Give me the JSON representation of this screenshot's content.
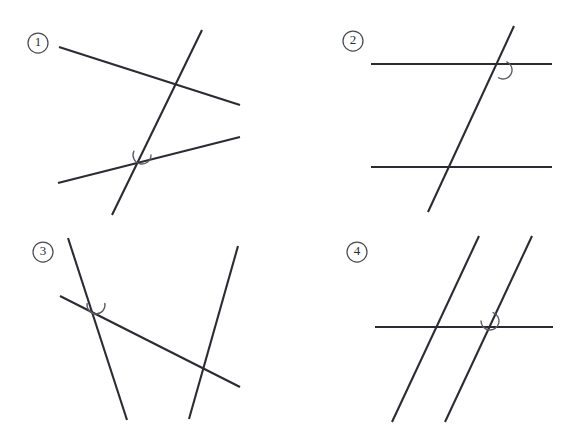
{
  "figure": {
    "width": 579,
    "height": 447,
    "background_color": "#ffffff",
    "line_color": "#2b2b33",
    "arc_color": "#5a5a62",
    "badge_color": "#4a4a52"
  },
  "panels": [
    {
      "id": "panel-1",
      "label": "1",
      "label_position": {
        "cx": 38,
        "cy": 43,
        "r": 10
      },
      "description": "Two non-parallel lines crossed by a steep transversal; angle arc at lower intersection",
      "lines": [
        {
          "name": "upper-line",
          "x1": 59,
          "y1": 47,
          "x2": 240,
          "y2": 105
        },
        {
          "name": "lower-line",
          "x1": 58,
          "y1": 183,
          "x2": 240,
          "y2": 137
        },
        {
          "name": "transversal",
          "x1": 202,
          "y1": 30,
          "x2": 112,
          "y2": 215
        }
      ],
      "angle_arc": {
        "cx": 142,
        "cy": 155,
        "r": 9,
        "start_deg": 0,
        "end_deg": 205
      }
    },
    {
      "id": "panel-2",
      "label": "2",
      "label_position": {
        "cx": 353,
        "cy": 41,
        "r": 10
      },
      "description": "Two horizontal parallel lines crossed by a transversal; angle arc at upper intersection",
      "lines": [
        {
          "name": "top-parallel",
          "x1": 371,
          "y1": 64,
          "x2": 552,
          "y2": 64
        },
        {
          "name": "bottom-parallel",
          "x1": 371,
          "y1": 167,
          "x2": 552,
          "y2": 167
        },
        {
          "name": "transversal",
          "x1": 514,
          "y1": 26,
          "x2": 428,
          "y2": 212
        }
      ],
      "angle_arc": {
        "cx": 503,
        "cy": 70,
        "r": 9,
        "start_deg": -65,
        "end_deg": 120
      }
    },
    {
      "id": "panel-3",
      "label": "3",
      "label_position": {
        "cx": 43,
        "cy": 252,
        "r": 10
      },
      "description": "Two converging steep lines crossed by a descending transversal; angle arc at left intersection",
      "lines": [
        {
          "name": "left-steep",
          "x1": 68,
          "y1": 238,
          "x2": 127,
          "y2": 420
        },
        {
          "name": "right-steep",
          "x1": 238,
          "y1": 246,
          "x2": 189,
          "y2": 419
        },
        {
          "name": "transversal",
          "x1": 60,
          "y1": 296,
          "x2": 240,
          "y2": 387
        }
      ],
      "angle_arc": {
        "cx": 96,
        "cy": 305,
        "r": 9,
        "start_deg": -10,
        "end_deg": 190
      }
    },
    {
      "id": "panel-4",
      "label": "4",
      "label_position": {
        "cx": 357,
        "cy": 252,
        "r": 10
      },
      "description": "Two parallel slanted lines crossed by a horizontal line; angle arc at right intersection",
      "lines": [
        {
          "name": "left-parallel",
          "x1": 479,
          "y1": 236,
          "x2": 392,
          "y2": 422
        },
        {
          "name": "right-parallel",
          "x1": 532,
          "y1": 236,
          "x2": 445,
          "y2": 422
        },
        {
          "name": "horizontal",
          "x1": 375,
          "y1": 327,
          "x2": 553,
          "y2": 327
        }
      ],
      "angle_arc": {
        "cx": 490,
        "cy": 321,
        "r": 9,
        "start_deg": -70,
        "end_deg": 180
      }
    }
  ]
}
